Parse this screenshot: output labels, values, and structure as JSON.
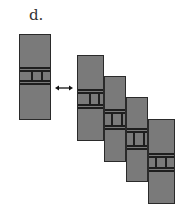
{
  "panel_label": "d.",
  "colors": {
    "fill": "#7a7a7a",
    "stroke": "#1e1e1e",
    "background": "#ffffff"
  },
  "left_block": {
    "x": 19,
    "y": 34,
    "w": 32,
    "h": 86,
    "band": [
      32,
      35,
      45,
      48
    ],
    "dividers": [
      11,
      21
    ]
  },
  "arrow": {
    "type": "double-headed",
    "x1": 55,
    "x2": 73,
    "y": 88
  },
  "stack_blocks": [
    {
      "x": 77,
      "y": 55,
      "w": 27,
      "h": 86,
      "band": [
        33,
        36,
        48,
        51
      ],
      "dividers": [
        11,
        20
      ]
    },
    {
      "x": 104,
      "y": 76,
      "w": 22,
      "h": 86,
      "band": [
        32,
        35,
        48,
        51
      ],
      "dividers": [
        6,
        16
      ]
    },
    {
      "x": 126,
      "y": 97,
      "w": 22,
      "h": 85,
      "band": [
        30,
        33,
        47,
        50
      ],
      "dividers": [
        6,
        16
      ]
    },
    {
      "x": 148,
      "y": 119,
      "w": 27,
      "h": 85,
      "band": [
        33,
        36,
        47,
        50
      ],
      "dividers": [
        6,
        16
      ]
    }
  ]
}
